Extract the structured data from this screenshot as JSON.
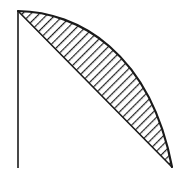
{
  "figure": {
    "kind": "geometry-diagram",
    "canvas": {
      "width": 189,
      "height": 171,
      "background": "#ffffff"
    },
    "colors": {
      "stroke": "#1a1a1a",
      "fill": "#ffffff",
      "hatch": "#1a1a1a",
      "background": "#ffffff"
    },
    "points": {
      "apex": {
        "x": 18,
        "y": 11,
        "label": "apex"
      },
      "tip": {
        "x": 172,
        "y": 167,
        "label": "tip"
      },
      "axis_bottom": {
        "x": 18,
        "y": 168,
        "label": "axis-bottom"
      },
      "arc_control": {
        "x": 150,
        "y": 14,
        "label": "arc-control"
      }
    },
    "elements": {
      "vertical_axis": {
        "name": "vertical axis line",
        "path": "M 18 11 L 18 168",
        "stroke_width": 1.6
      },
      "chord": {
        "name": "straight chord",
        "path": "M 18 11 L 172 167",
        "stroke_width": 1.6
      },
      "arc": {
        "name": "outer circular arc",
        "path": "M 18 11 C 78 12 150 52 172 167",
        "stroke_width": 2.2
      },
      "segment": {
        "name": "hatched circular segment",
        "path": "M 18 11 C 78 12 150 52 172 167 L 18 11 Z"
      }
    },
    "hatching": {
      "style": "beaded diagonal lines",
      "angle_degrees": 45,
      "spacing_px": 6,
      "line_width": 1.4,
      "direction": "lower-left to upper-right"
    }
  }
}
